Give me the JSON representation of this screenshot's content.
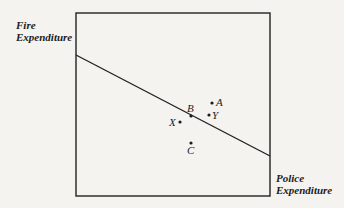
{
  "diagram": {
    "y_axis_label": [
      "Fire",
      "Expenditure"
    ],
    "x_axis_label": [
      "Police",
      "Expenditure"
    ],
    "line": "budget-line",
    "points": [
      {
        "label": "A",
        "x": 216,
        "y": 103
      },
      {
        "label": "B",
        "x": 190,
        "y": 114
      },
      {
        "label": "Y",
        "x": 209,
        "y": 115
      },
      {
        "label": "X",
        "x": 179,
        "y": 122
      },
      {
        "label": "C",
        "x": 191,
        "y": 143
      }
    ]
  }
}
